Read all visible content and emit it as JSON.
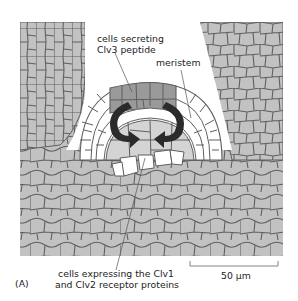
{
  "figure": {
    "panel_label": "(A)",
    "labels": {
      "clv3_line1": "cells secreting",
      "clv3_line2": "Clv3 peptide",
      "meristem": "meristem",
      "receptor_line1": "cells expressing the Clv1",
      "receptor_line2": "and Clv2 receptor proteins"
    },
    "scale_bar": {
      "label": "50 µm"
    },
    "colors": {
      "tissue_fill": "#c2c2c2",
      "cell_wall": "#5f5f5f",
      "clv3_cells": "#9a9a9a",
      "meristem_outer_layer": "#ffffff",
      "meristem_interior": "#d4d4d4",
      "arrow": "#2b2b2b",
      "background": "#ffffff"
    }
  }
}
